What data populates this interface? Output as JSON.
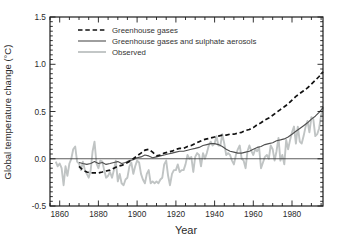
{
  "figure": {
    "background": "#ffffff",
    "axis_color": "#1c1c1c",
    "text_color": "#2a2a2a",
    "zero_line_color": "#333333"
  },
  "chart_data": {
    "type": "line",
    "title": "",
    "xlabel": "Year",
    "ylabel": "Global temperature change (°C)",
    "xlim": [
      1855,
      1996
    ],
    "ylim": [
      -0.5,
      1.5
    ],
    "xticks": [
      1860,
      1880,
      1900,
      1920,
      1940,
      1960,
      1980
    ],
    "x_minor_step": 5,
    "yticks": [
      -0.5,
      0.0,
      0.5,
      1.0,
      1.5
    ],
    "ytick_labels": [
      "-0.5",
      "0.0",
      "0.5",
      "1.0",
      "1.5"
    ],
    "y_minor_step": 0.05,
    "grid": false,
    "zero_line": true,
    "legend_position": "top-left",
    "series": [
      {
        "name": "Greenhouse gases",
        "style": "dashed",
        "color": "#111111",
        "width": 1.7,
        "dash": "4.5,2.8",
        "points": [
          [
            1870,
            -0.08
          ],
          [
            1872,
            -0.12
          ],
          [
            1874,
            -0.14
          ],
          [
            1876,
            -0.15
          ],
          [
            1878,
            -0.15
          ],
          [
            1880,
            -0.15
          ],
          [
            1882,
            -0.14
          ],
          [
            1884,
            -0.13
          ],
          [
            1886,
            -0.12
          ],
          [
            1888,
            -0.1
          ],
          [
            1890,
            -0.08
          ],
          [
            1892,
            -0.07
          ],
          [
            1894,
            -0.05
          ],
          [
            1896,
            -0.03
          ],
          [
            1898,
            0.0
          ],
          [
            1900,
            0.03
          ],
          [
            1902,
            0.06
          ],
          [
            1904,
            0.09
          ],
          [
            1906,
            0.1
          ],
          [
            1908,
            0.07
          ],
          [
            1910,
            0.03
          ],
          [
            1912,
            0.04
          ],
          [
            1914,
            0.06
          ],
          [
            1916,
            0.07
          ],
          [
            1918,
            0.08
          ],
          [
            1920,
            0.1
          ],
          [
            1922,
            0.11
          ],
          [
            1924,
            0.11
          ],
          [
            1926,
            0.13
          ],
          [
            1928,
            0.14
          ],
          [
            1930,
            0.16
          ],
          [
            1932,
            0.18
          ],
          [
            1934,
            0.2
          ],
          [
            1936,
            0.21
          ],
          [
            1938,
            0.22
          ],
          [
            1940,
            0.23
          ],
          [
            1942,
            0.24
          ],
          [
            1944,
            0.25
          ],
          [
            1946,
            0.25
          ],
          [
            1948,
            0.26
          ],
          [
            1950,
            0.26
          ],
          [
            1952,
            0.27
          ],
          [
            1954,
            0.28
          ],
          [
            1956,
            0.3
          ],
          [
            1958,
            0.31
          ],
          [
            1960,
            0.33
          ],
          [
            1962,
            0.36
          ],
          [
            1964,
            0.38
          ],
          [
            1966,
            0.41
          ],
          [
            1968,
            0.43
          ],
          [
            1970,
            0.46
          ],
          [
            1972,
            0.49
          ],
          [
            1974,
            0.52
          ],
          [
            1976,
            0.55
          ],
          [
            1978,
            0.58
          ],
          [
            1980,
            0.62
          ],
          [
            1982,
            0.66
          ],
          [
            1984,
            0.69
          ],
          [
            1986,
            0.72
          ],
          [
            1988,
            0.75
          ],
          [
            1990,
            0.79
          ],
          [
            1992,
            0.83
          ],
          [
            1994,
            0.87
          ],
          [
            1996,
            0.92
          ]
        ]
      },
      {
        "name": "Greenhouse gases and sulphate aerosols",
        "style": "solid",
        "color": "#4f4f4f",
        "width": 1.1,
        "dash": "",
        "points": [
          [
            1870,
            -0.04
          ],
          [
            1872,
            -0.05
          ],
          [
            1874,
            -0.06
          ],
          [
            1876,
            -0.05
          ],
          [
            1878,
            -0.03
          ],
          [
            1880,
            -0.05
          ],
          [
            1882,
            -0.04
          ],
          [
            1884,
            -0.06
          ],
          [
            1886,
            -0.05
          ],
          [
            1888,
            -0.04
          ],
          [
            1890,
            -0.03
          ],
          [
            1892,
            -0.05
          ],
          [
            1894,
            -0.04
          ],
          [
            1896,
            -0.02
          ],
          [
            1898,
            -0.01
          ],
          [
            1900,
            0.01
          ],
          [
            1902,
            0.02
          ],
          [
            1904,
            0.04
          ],
          [
            1906,
            0.03
          ],
          [
            1908,
            0.01
          ],
          [
            1910,
            0.02
          ],
          [
            1912,
            0.03
          ],
          [
            1914,
            0.04
          ],
          [
            1916,
            0.05
          ],
          [
            1918,
            0.06
          ],
          [
            1920,
            0.07
          ],
          [
            1922,
            0.08
          ],
          [
            1924,
            0.08
          ],
          [
            1926,
            0.09
          ],
          [
            1928,
            0.1
          ],
          [
            1930,
            0.11
          ],
          [
            1932,
            0.12
          ],
          [
            1934,
            0.14
          ],
          [
            1936,
            0.15
          ],
          [
            1938,
            0.16
          ],
          [
            1940,
            0.16
          ],
          [
            1942,
            0.15
          ],
          [
            1944,
            0.13
          ],
          [
            1946,
            0.1
          ],
          [
            1948,
            0.08
          ],
          [
            1950,
            0.07
          ],
          [
            1952,
            0.06
          ],
          [
            1954,
            0.06
          ],
          [
            1956,
            0.07
          ],
          [
            1958,
            0.08
          ],
          [
            1960,
            0.1
          ],
          [
            1962,
            0.12
          ],
          [
            1964,
            0.13
          ],
          [
            1966,
            0.15
          ],
          [
            1968,
            0.16
          ],
          [
            1970,
            0.17
          ],
          [
            1972,
            0.19
          ],
          [
            1974,
            0.2
          ],
          [
            1976,
            0.21
          ],
          [
            1978,
            0.23
          ],
          [
            1980,
            0.26
          ],
          [
            1982,
            0.29
          ],
          [
            1984,
            0.32
          ],
          [
            1986,
            0.35
          ],
          [
            1988,
            0.38
          ],
          [
            1990,
            0.42
          ],
          [
            1992,
            0.45
          ],
          [
            1994,
            0.49
          ],
          [
            1996,
            0.54
          ]
        ]
      },
      {
        "name": "Observed",
        "style": "solid",
        "color": "#c0c4c4",
        "width": 1.9,
        "dash": "",
        "points": [
          [
            1858,
            -0.03
          ],
          [
            1859,
            -0.08
          ],
          [
            1860,
            -0.05
          ],
          [
            1861,
            -0.1
          ],
          [
            1862,
            -0.28
          ],
          [
            1863,
            -0.08
          ],
          [
            1864,
            -0.18
          ],
          [
            1865,
            -0.05
          ],
          [
            1866,
            0.0
          ],
          [
            1867,
            0.1
          ],
          [
            1868,
            0.13
          ],
          [
            1869,
            -0.03
          ],
          [
            1870,
            -0.05
          ],
          [
            1871,
            -0.12
          ],
          [
            1872,
            -0.03
          ],
          [
            1873,
            -0.12
          ],
          [
            1874,
            -0.16
          ],
          [
            1875,
            -0.2
          ],
          [
            1876,
            -0.12
          ],
          [
            1877,
            0.08
          ],
          [
            1878,
            0.18
          ],
          [
            1879,
            -0.05
          ],
          [
            1880,
            -0.1
          ],
          [
            1881,
            -0.02
          ],
          [
            1882,
            -0.03
          ],
          [
            1883,
            -0.12
          ],
          [
            1884,
            -0.2
          ],
          [
            1885,
            -0.18
          ],
          [
            1886,
            -0.14
          ],
          [
            1887,
            -0.2
          ],
          [
            1888,
            -0.12
          ],
          [
            1889,
            -0.02
          ],
          [
            1890,
            -0.24
          ],
          [
            1891,
            -0.16
          ],
          [
            1892,
            -0.26
          ],
          [
            1893,
            -0.28
          ],
          [
            1894,
            -0.22
          ],
          [
            1895,
            -0.2
          ],
          [
            1896,
            -0.08
          ],
          [
            1897,
            -0.04
          ],
          [
            1898,
            -0.16
          ],
          [
            1899,
            -0.08
          ],
          [
            1900,
            -0.02
          ],
          [
            1901,
            -0.04
          ],
          [
            1902,
            -0.16
          ],
          [
            1903,
            -0.22
          ],
          [
            1904,
            -0.26
          ],
          [
            1905,
            -0.16
          ],
          [
            1906,
            -0.12
          ],
          [
            1907,
            -0.26
          ],
          [
            1908,
            -0.24
          ],
          [
            1909,
            -0.26
          ],
          [
            1910,
            -0.24
          ],
          [
            1911,
            -0.26
          ],
          [
            1912,
            -0.22
          ],
          [
            1913,
            -0.2
          ],
          [
            1914,
            -0.06
          ],
          [
            1915,
            -0.02
          ],
          [
            1916,
            -0.18
          ],
          [
            1917,
            -0.28
          ],
          [
            1918,
            -0.16
          ],
          [
            1919,
            -0.12
          ],
          [
            1920,
            -0.12
          ],
          [
            1921,
            -0.06
          ],
          [
            1922,
            -0.14
          ],
          [
            1923,
            -0.12
          ],
          [
            1924,
            -0.12
          ],
          [
            1925,
            -0.06
          ],
          [
            1926,
            0.04
          ],
          [
            1927,
            0.0
          ],
          [
            1928,
            0.02
          ],
          [
            1929,
            -0.14
          ],
          [
            1930,
            0.02
          ],
          [
            1931,
            0.06
          ],
          [
            1932,
            0.04
          ],
          [
            1933,
            -0.08
          ],
          [
            1934,
            0.06
          ],
          [
            1935,
            0.0
          ],
          [
            1936,
            0.06
          ],
          [
            1937,
            0.14
          ],
          [
            1938,
            0.18
          ],
          [
            1939,
            0.14
          ],
          [
            1940,
            0.16
          ],
          [
            1941,
            0.24
          ],
          [
            1942,
            0.14
          ],
          [
            1943,
            0.14
          ],
          [
            1944,
            0.26
          ],
          [
            1945,
            0.16
          ],
          [
            1946,
            0.04
          ],
          [
            1947,
            0.06
          ],
          [
            1948,
            0.04
          ],
          [
            1949,
            -0.02
          ],
          [
            1950,
            -0.06
          ],
          [
            1951,
            0.04
          ],
          [
            1952,
            0.1
          ],
          [
            1953,
            0.14
          ],
          [
            1954,
            0.0
          ],
          [
            1955,
            -0.02
          ],
          [
            1956,
            -0.1
          ],
          [
            1957,
            0.08
          ],
          [
            1958,
            0.14
          ],
          [
            1959,
            0.08
          ],
          [
            1960,
            0.04
          ],
          [
            1961,
            0.1
          ],
          [
            1962,
            0.08
          ],
          [
            1963,
            0.12
          ],
          [
            1964,
            -0.1
          ],
          [
            1965,
            -0.04
          ],
          [
            1966,
            0.02
          ],
          [
            1967,
            0.04
          ],
          [
            1968,
            0.0
          ],
          [
            1969,
            0.14
          ],
          [
            1970,
            0.1
          ],
          [
            1971,
            -0.02
          ],
          [
            1972,
            0.08
          ],
          [
            1973,
            0.22
          ],
          [
            1974,
            -0.02
          ],
          [
            1975,
            0.04
          ],
          [
            1976,
            -0.06
          ],
          [
            1977,
            0.2
          ],
          [
            1978,
            0.1
          ],
          [
            1979,
            0.2
          ],
          [
            1980,
            0.28
          ],
          [
            1981,
            0.34
          ],
          [
            1982,
            0.16
          ],
          [
            1983,
            0.34
          ],
          [
            1984,
            0.18
          ],
          [
            1985,
            0.16
          ],
          [
            1986,
            0.24
          ],
          [
            1987,
            0.34
          ],
          [
            1988,
            0.4
          ],
          [
            1989,
            0.28
          ],
          [
            1990,
            0.44
          ],
          [
            1991,
            0.42
          ],
          [
            1992,
            0.24
          ],
          [
            1993,
            0.26
          ],
          [
            1994,
            0.32
          ],
          [
            1995,
            0.46
          ],
          [
            1996,
            0.55
          ]
        ]
      }
    ]
  }
}
